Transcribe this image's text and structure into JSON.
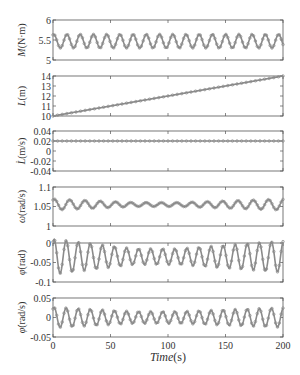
{
  "chart_data": [
    {
      "type": "line",
      "ylabel": "M (N·m)",
      "ylabel_italic": "M",
      "ylabel_unit": "(N·m)",
      "ylim": [
        5,
        6
      ],
      "yticks": [
        "5",
        "5.5",
        "6"
      ],
      "xlim": [
        0,
        200
      ],
      "grid": false,
      "series": [
        {
          "name": "M",
          "model": "sine",
          "mean": 5.47,
          "amplitude": 0.17,
          "period_s": 11.5,
          "marker": "circle"
        }
      ],
      "top_px": 20,
      "bottom_px": 60
    },
    {
      "type": "line",
      "ylabel": "L(m)",
      "ylabel_italic": "L",
      "ylabel_unit": "(m)",
      "ylim": [
        10,
        14
      ],
      "yticks": [
        "10",
        "11",
        "12",
        "13",
        "14"
      ],
      "xlim": [
        0,
        200
      ],
      "grid": false,
      "series": [
        {
          "name": "L",
          "model": "linear",
          "x": [
            0,
            200
          ],
          "y": [
            10,
            14
          ],
          "marker": "circle"
        }
      ],
      "top_px": 76,
      "bottom_px": 116
    },
    {
      "type": "line",
      "ylabel": "L̇(m/s)",
      "ylabel_italic": "L̇",
      "ylabel_unit": "(m/s)",
      "ylim": [
        -0.04,
        0.04
      ],
      "yticks": [
        "-0.04",
        "-0.02",
        "0",
        "0.02",
        "0.04"
      ],
      "xlim": [
        0,
        200
      ],
      "grid": false,
      "series": [
        {
          "name": "Ldot",
          "model": "constant",
          "value": 0.02,
          "marker": "circle"
        }
      ],
      "top_px": 131,
      "bottom_px": 171
    },
    {
      "type": "line",
      "ylabel": "ω(rad/s)",
      "ylabel_italic": "ω",
      "ylabel_unit": "(rad/s)",
      "ylim": [
        1,
        1.1
      ],
      "yticks": [
        "1",
        "1.05",
        "1.1"
      ],
      "xlim": [
        0,
        200
      ],
      "grid": false,
      "series": [
        {
          "name": "omega",
          "model": "modulated_sine",
          "mean": 1.055,
          "amp_start": 0.014,
          "amp_mid": 0.005,
          "amp_end": 0.014,
          "period_s": 13.3,
          "marker": "circle"
        }
      ],
      "top_px": 187,
      "bottom_px": 226
    },
    {
      "type": "line",
      "ylabel": "φ(rad)",
      "ylabel_italic": "φ",
      "ylabel_unit": "(rad)",
      "ylim": [
        -0.1,
        0
      ],
      "yticks": [
        "-0.1",
        "-0.05",
        "0"
      ],
      "xlim": [
        0,
        200
      ],
      "grid": false,
      "series": [
        {
          "name": "phi",
          "model": "modulated_sine",
          "mean": -0.035,
          "amp_start": 0.045,
          "amp_mid": 0.02,
          "amp_end": 0.04,
          "period_s": 10.5,
          "marker": "circle"
        }
      ],
      "top_px": 243,
      "bottom_px": 282
    },
    {
      "type": "line",
      "ylabel": "φ̇(rad/s)",
      "ylabel_italic": "φ̇",
      "ylabel_unit": "(rad/s)",
      "ylim": [
        -0.05,
        0.05
      ],
      "yticks": [
        "-0.05",
        "0",
        "0.05"
      ],
      "xlim": [
        0,
        200
      ],
      "xticks": [
        "0",
        "50",
        "100",
        "150",
        "200"
      ],
      "xlabel": "Time(s)",
      "grid": false,
      "series": [
        {
          "name": "phidot",
          "model": "modulated_sine",
          "mean": 0.0,
          "amp_start": 0.026,
          "amp_mid": 0.015,
          "amp_end": 0.025,
          "period_s": 10.5,
          "marker": "circle"
        }
      ],
      "top_px": 298,
      "bottom_px": 337
    }
  ],
  "xaxis": {
    "ticks": [
      "0",
      "50",
      "100",
      "150",
      "200"
    ],
    "title_italic": "Time",
    "title_unit": "(s)"
  },
  "colors": {
    "line": "#8a8a8a",
    "axis": "#555555",
    "text": "#333333"
  }
}
